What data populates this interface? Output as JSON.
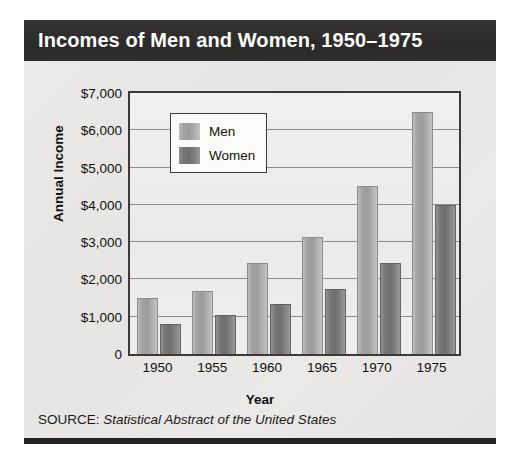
{
  "figure": {
    "title": "Incomes of Men and Women, 1950–1975",
    "source_label": "SOURCE:",
    "source_value": "Statistical Abstract of the United States",
    "title_bar_color": "#2e2c2b",
    "panel_color": "#e9e9e7",
    "plot_color": "#eeeeec",
    "frame_color": "#3b3a39"
  },
  "chart_data": {
    "type": "bar",
    "title": "Incomes of Men and Women, 1950–1975",
    "xlabel": "Year",
    "ylabel": "Annual Income",
    "categories": [
      "1950",
      "1955",
      "1960",
      "1965",
      "1970",
      "1975"
    ],
    "series": [
      {
        "name": "Men",
        "color": "#a9a9a7",
        "values": [
          1500,
          1700,
          2450,
          3150,
          4500,
          6500
        ]
      },
      {
        "name": "Women",
        "color": "#7d7d7b",
        "values": [
          800,
          1050,
          1350,
          1750,
          2450,
          4000
        ]
      }
    ],
    "ylim": [
      0,
      7000
    ],
    "ytick_values": [
      0,
      1000,
      2000,
      3000,
      4000,
      5000,
      6000,
      7000
    ],
    "ytick_labels": [
      "0",
      "$1,000",
      "$2,000",
      "$3,000",
      "$4,000",
      "$5,000",
      "$6,000",
      "$7,000"
    ],
    "grid": true,
    "legend_position": "upper-left",
    "legend_entries": [
      "Men",
      "Women"
    ]
  }
}
